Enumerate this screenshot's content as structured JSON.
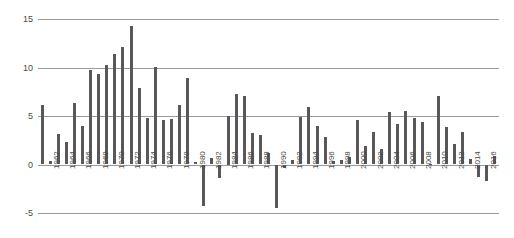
{
  "chart_data": {
    "type": "bar",
    "title": "",
    "subtitle": "",
    "xlabel": "",
    "ylabel": "",
    "ylim": [
      -5,
      15
    ],
    "yticks": [
      15,
      10,
      5,
      0,
      -5
    ],
    "ytick_labels": [
      "15",
      "10",
      "5",
      "0",
      "-5"
    ],
    "grid": true,
    "legend": false,
    "legend_position": "none",
    "bar_color": "#58585a",
    "gridline_color": "#9b9b9b",
    "axis_text_color": "#4a4a4a",
    "background_color": "#ffffff",
    "xtick_step": 2,
    "xtick_labels": [
      "1962",
      "1964",
      "1966",
      "1968",
      "1970",
      "1972",
      "1974",
      "1976",
      "1978",
      "1980",
      "1982",
      "1984",
      "1986",
      "1988",
      "1990",
      "1992",
      "1994",
      "1996",
      "1998",
      "2000",
      "2002",
      "2004",
      "2006",
      "2008",
      "2010",
      "2012",
      "2014",
      "2016"
    ],
    "categories": [
      "1961",
      "1962",
      "1963",
      "1964",
      "1965",
      "1966",
      "1967",
      "1968",
      "1969",
      "1970",
      "1971",
      "1972",
      "1973",
      "1974",
      "1975",
      "1976",
      "1977",
      "1978",
      "1979",
      "1980",
      "1981",
      "1982",
      "1983",
      "1984",
      "1985",
      "1986",
      "1987",
      "1988",
      "1989",
      "1990",
      "1991",
      "1992",
      "1993",
      "1994",
      "1995",
      "1996",
      "1997",
      "1998",
      "1999",
      "2000",
      "2001",
      "2002",
      "2003",
      "2004",
      "2005",
      "2006",
      "2007",
      "2008",
      "2009",
      "2010",
      "2011",
      "2012",
      "2013",
      "2014",
      "2015",
      "2016",
      "2017"
    ],
    "values": [
      6.1,
      0.4,
      3.1,
      2.3,
      6.3,
      4.0,
      9.7,
      9.3,
      10.3,
      11.4,
      12.1,
      14.3,
      7.9,
      4.8,
      10.1,
      4.6,
      4.7,
      6.1,
      8.9,
      0.3,
      -4.3,
      0.7,
      -1.4,
      5.0,
      7.3,
      7.1,
      3.2,
      3.0,
      1.2,
      -4.5,
      -0.4,
      0.5,
      4.9,
      5.9,
      4.0,
      2.8,
      0.4,
      0.5,
      0.8,
      4.6,
      1.9,
      3.4,
      1.6,
      5.4,
      4.2,
      5.5,
      4.8,
      4.4,
      0.05,
      7.1,
      3.9,
      2.1,
      3.3,
      0.6,
      -1.3,
      -1.7,
      0.9
    ]
  }
}
